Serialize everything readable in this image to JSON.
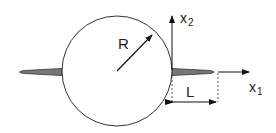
{
  "diagram": {
    "labels": {
      "radius": "R",
      "crack_length": "L",
      "axis_x1_main": "x",
      "axis_x1_sub": "1",
      "axis_x2_main": "x",
      "axis_x2_sub": "2"
    },
    "colors": {
      "stroke": "#222222",
      "crack_fill": "#777777",
      "background": "#ffffff"
    }
  }
}
